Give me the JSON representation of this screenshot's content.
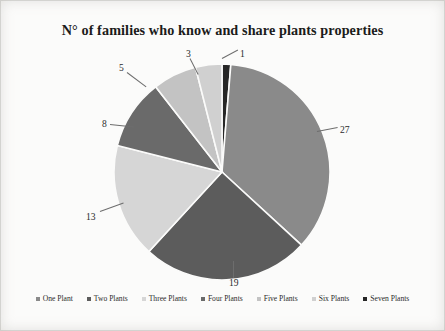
{
  "document": {
    "background_color": "#fbfbfa",
    "page_tint": "#f2f1ef"
  },
  "chart_data": {
    "type": "pie",
    "title": "N° of families who know and share plants properties",
    "xlabel": "",
    "ylabel": "",
    "legend_position": "bottom",
    "grid": false,
    "total": 76,
    "categories": [
      "One Plant",
      "Two Plants",
      "Three Plants",
      "Four Plants",
      "Five Plants",
      "Six Plants",
      "Seven Plants"
    ],
    "values": [
      27,
      19,
      13,
      8,
      5,
      3,
      1
    ],
    "colors": [
      "#8a8a8a",
      "#5c5c5c",
      "#d6d6d6",
      "#6a6a6a",
      "#c3c3c3",
      "#d0d0d0",
      "#262626"
    ],
    "slices": [
      {
        "label": "One Plant",
        "value": 27,
        "data_label": "27",
        "color": "#8a8a8a",
        "start_angle": 4.7,
        "end_angle": 132.6
      },
      {
        "label": "Two Plants",
        "value": 19,
        "data_label": "19",
        "color": "#5c5c5c",
        "start_angle": 132.6,
        "end_angle": 222.6
      },
      {
        "label": "Three Plants",
        "value": 13,
        "data_label": "13",
        "color": "#d6d6d6",
        "start_angle": 222.6,
        "end_angle": 284.2
      },
      {
        "label": "Four Plants",
        "value": 8,
        "data_label": "8",
        "color": "#6a6a6a",
        "start_angle": 284.2,
        "end_angle": 322.1
      },
      {
        "label": "Five Plants",
        "value": 5,
        "data_label": "5",
        "color": "#c3c3c3",
        "start_angle": 322.1,
        "end_angle": 345.8
      },
      {
        "label": "Six Plants",
        "value": 3,
        "data_label": "3",
        "color": "#d0d0d0",
        "start_angle": 345.8,
        "end_angle": 360.0
      },
      {
        "label": "Seven Plants",
        "value": 1,
        "data_label": "1",
        "color": "#262626",
        "start_angle": 0.0,
        "end_angle": 4.7
      }
    ]
  },
  "labels": {
    "v27": "27",
    "v19": "19",
    "v13": "13",
    "v8": "8",
    "v5": "5",
    "v3": "3",
    "v1": "1"
  },
  "legend": {
    "items": [
      {
        "label": "One Plant",
        "color": "#8a8a8a"
      },
      {
        "label": "Two Plants",
        "color": "#5c5c5c"
      },
      {
        "label": "Three Plants",
        "color": "#d6d6d6"
      },
      {
        "label": "Four Plants",
        "color": "#6a6a6a"
      },
      {
        "label": "Five Plants",
        "color": "#c3c3c3"
      },
      {
        "label": "Six Plants",
        "color": "#d0d0d0"
      },
      {
        "label": "Seven Plants",
        "color": "#262626"
      }
    ]
  }
}
